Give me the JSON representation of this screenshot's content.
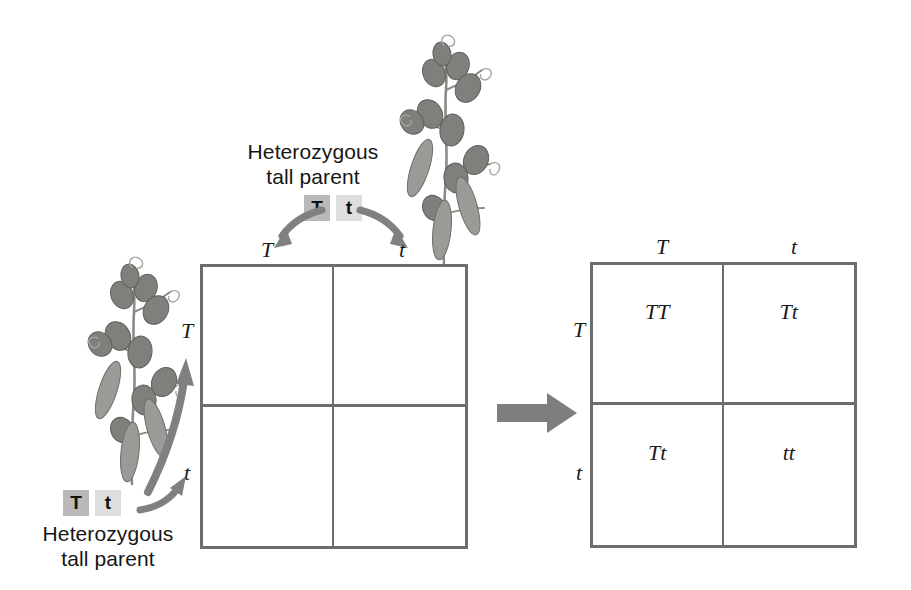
{
  "diagram": {
    "type": "punnett-square",
    "trait": "plant height",
    "dominant_allele": "T",
    "recessive_allele": "t"
  },
  "parents": {
    "top": {
      "caption": "Heterozygous\ntall parent",
      "genotype": [
        "T",
        "t"
      ],
      "gamete_labels": [
        "T",
        "t"
      ],
      "role": "column-parent"
    },
    "left": {
      "caption": "Heterozygous\ntall parent",
      "genotype": [
        "T",
        "t"
      ],
      "gamete_labels": [
        "T",
        "t"
      ],
      "role": "row-parent"
    }
  },
  "squares": {
    "blank": {
      "name": "empty-punnett-square",
      "column_headers": [
        "T",
        "t"
      ],
      "row_headers": [
        "T",
        "t"
      ],
      "cells": [
        [
          "",
          ""
        ],
        [
          "",
          ""
        ]
      ]
    },
    "filled": {
      "name": "completed-punnett-square",
      "column_headers": [
        "T",
        "t"
      ],
      "row_headers": [
        "T",
        "t"
      ],
      "cells": [
        [
          "TT",
          "Tt"
        ],
        [
          "Tt",
          "tt"
        ]
      ]
    }
  },
  "colors": {
    "dominant_chip": "#b9b9b9",
    "recessive_chip": "#dedede",
    "grid_line": "#6d6d6d",
    "arrow": "#808080",
    "text": "#1a1a1a",
    "background": "#ffffff"
  },
  "icons": {
    "transition_arrow": "right-block-arrow",
    "gamete_arrow": "curved-arrow",
    "plant": "pea-plant-illustration"
  }
}
